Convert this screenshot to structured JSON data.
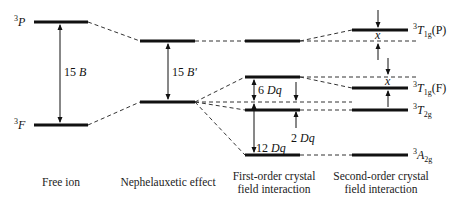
{
  "diagram": {
    "type": "energy-level splitting diagram",
    "columns": [
      {
        "id": "free-ion",
        "caption_lines": [
          "Free ion"
        ]
      },
      {
        "id": "nephelauxetic",
        "caption_lines": [
          "Nephelauxetic effect"
        ]
      },
      {
        "id": "first-order",
        "caption_lines": [
          "First-order crystal",
          "field interaction"
        ]
      },
      {
        "id": "second-order",
        "caption_lines": [
          "Second-order crystal",
          "field interaction"
        ]
      }
    ],
    "free_ion_terms": {
      "upper": {
        "sup": "3",
        "symbol": "P"
      },
      "lower": {
        "sup": "3",
        "symbol": "F"
      }
    },
    "gaps": {
      "free_ion": {
        "num": "15",
        "sym": "B"
      },
      "nephelauxetic": {
        "num": "15",
        "sym": "B'"
      },
      "six_dq": {
        "num": "6",
        "sym": "Dq"
      },
      "two_dq": {
        "num": "2",
        "sym": "Dq"
      },
      "twelve_dq": {
        "num": "12",
        "sym": "Dq"
      },
      "x_upper": "x",
      "x_lower": "x"
    },
    "final_terms": [
      {
        "sup": "3",
        "base": "T",
        "sub": "1g",
        "suffix": "(P)"
      },
      {
        "sup": "3",
        "base": "T",
        "sub": "1g",
        "suffix": "(F)"
      },
      {
        "sup": "3",
        "base": "T",
        "sub": "2g",
        "suffix": ""
      },
      {
        "sup": "3",
        "base": "A",
        "sub": "2g",
        "suffix": ""
      }
    ]
  }
}
